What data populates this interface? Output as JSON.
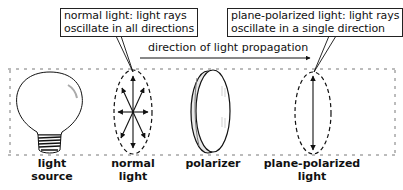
{
  "callouts": {
    "normal": {
      "line1": "normal light: light rays",
      "line2": "oscillate in all directions"
    },
    "polarized": {
      "line1": "plane-polarized light: light rays",
      "line2": "oscillate in a single direction"
    }
  },
  "propagation_label": "direction of light propagation",
  "labels": {
    "light_source": [
      "light",
      "source"
    ],
    "normal_light": [
      "normal",
      "light"
    ],
    "polarizer": [
      "polarizer"
    ],
    "plane_polarized_light": [
      "plane-polarized",
      "light"
    ]
  },
  "colors": {
    "ink": "#111111",
    "background": "#ffffff"
  }
}
